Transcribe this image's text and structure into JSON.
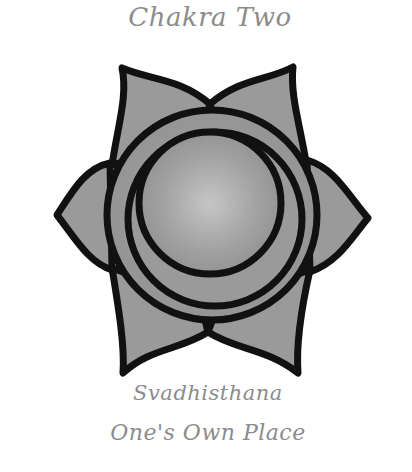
{
  "title": "Chakra Two",
  "sanskrit_name": "Svadhisthana",
  "meaning": "One's Own Place",
  "emblem": {
    "icon": "sacral-chakra-lotus-icon",
    "petals": 6,
    "colors": {
      "outline": "#111111",
      "petal_fill": "#9a9a9a",
      "sphere_highlight": "#c4c4c4",
      "sphere_shade": "#8a8a8a",
      "text": "#8c8c8c"
    }
  }
}
